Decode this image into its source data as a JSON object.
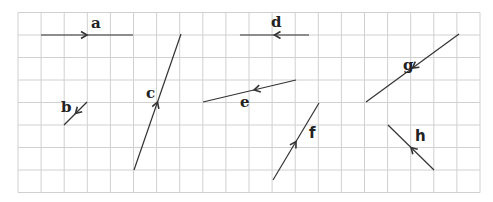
{
  "diagram": {
    "type": "vector-grid",
    "background": "#ffffff",
    "grid": {
      "x0": 18,
      "y0": 12.5,
      "dx": 23.1,
      "dy": 22.5,
      "cols": 20,
      "rows": 8,
      "color": "#d0d0d0"
    },
    "line_color": "#333333",
    "vectors": [
      {
        "label": "a",
        "from": [
          41,
          35
        ],
        "to": [
          133,
          35
        ],
        "arrow_at": 0.5,
        "label_pos": [
          91,
          28
        ],
        "font": "serif"
      },
      {
        "label": "b",
        "from": [
          87,
          102
        ],
        "to": [
          64,
          125
        ],
        "arrow_at": 0.5,
        "label_pos": [
          61,
          112
        ],
        "font": "serif"
      },
      {
        "label": "c",
        "from": [
          134,
          170
        ],
        "to": [
          181,
          34
        ],
        "arrow_at": 0.5,
        "label_pos": [
          146,
          98
        ],
        "font": "serif"
      },
      {
        "label": "d",
        "from": [
          309,
          35
        ],
        "to": [
          240,
          35
        ],
        "arrow_at": 0.5,
        "label_pos": [
          271,
          27
        ],
        "font": "serif"
      },
      {
        "label": "e",
        "from": [
          296,
          80
        ],
        "to": [
          203,
          102
        ],
        "arrow_at": 0.45,
        "label_pos": [
          240,
          107
        ],
        "font": "serif"
      },
      {
        "label": "f",
        "from": [
          273,
          180
        ],
        "to": [
          319,
          103
        ],
        "arrow_at": 0.5,
        "label_pos": [
          309,
          138
        ],
        "font": "sans"
      },
      {
        "label": "g",
        "from": [
          459,
          34
        ],
        "to": [
          366,
          102
        ],
        "arrow_at": 0.5,
        "label_pos": [
          403,
          70
        ],
        "font": "serif"
      },
      {
        "label": "h",
        "from": [
          434,
          170
        ],
        "to": [
          388,
          125
        ],
        "arrow_at": 0.5,
        "label_pos": [
          415,
          141
        ],
        "font": "sans"
      }
    ]
  }
}
